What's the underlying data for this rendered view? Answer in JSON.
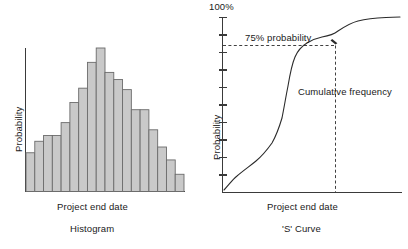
{
  "figure": {
    "background": "#ffffff",
    "ink_color": "#2b2b2b",
    "bar_fill": "#c9c9c9",
    "bar_stroke": "#6b6b6b"
  },
  "histogram": {
    "title": "Histogram",
    "xlabel": "Project end date",
    "ylabel": "Probability"
  },
  "scurve": {
    "title": "'S' Curve",
    "xlabel": "Project end date",
    "ylabel": "Probability",
    "top_tick_label": "100%",
    "annotation_threshold": "75% probability",
    "annotation_curve": "Cumulative frequency"
  },
  "chart_data": [
    {
      "type": "bar",
      "title": "Histogram",
      "xlabel": "Project end date",
      "ylabel": "Probability",
      "categories": [
        "1",
        "2",
        "3",
        "4",
        "5",
        "6",
        "7",
        "8",
        "9",
        "10",
        "11",
        "12",
        "13",
        "14",
        "15",
        "16",
        "17",
        "18"
      ],
      "values": [
        27,
        35,
        39,
        39,
        48,
        62,
        72,
        90,
        100,
        83,
        78,
        71,
        57,
        57,
        43,
        31,
        22,
        12
      ],
      "ylim": [
        0,
        100
      ],
      "grid": false,
      "legend": null,
      "axis_ticks_x": false,
      "axis_ticks_y": false,
      "note": "Bar heights are relative probability units; peak bar = 100."
    },
    {
      "type": "line",
      "title": "'S' Curve",
      "xlabel": "Project end date",
      "ylabel": "Probability",
      "ylim": [
        0,
        100
      ],
      "y_top_label": "100%",
      "y_tick_values": [
        0,
        10,
        20,
        30,
        40,
        50,
        60,
        70,
        80,
        90,
        100
      ],
      "grid": false,
      "legend": null,
      "series": [
        {
          "name": "Cumulative frequency",
          "x": [
            0,
            3,
            7,
            12,
            18,
            24,
            29,
            33,
            36,
            39,
            42,
            45,
            48,
            52,
            56,
            60,
            64,
            70,
            78,
            86,
            94,
            100
          ],
          "y": [
            1,
            4,
            7,
            10,
            13,
            16,
            19,
            23,
            30,
            40,
            52,
            61,
            67,
            72,
            76,
            83,
            87,
            89,
            91,
            93,
            94,
            95
          ]
        }
      ],
      "annotations": [
        {
          "text": "75% probability",
          "y_value": 76,
          "type": "threshold-dashed-horizontal"
        },
        {
          "text": "Cumulative frequency",
          "type": "curve-label"
        },
        {
          "text": "",
          "x_value": 56,
          "type": "threshold-dashed-vertical"
        }
      ]
    }
  ]
}
